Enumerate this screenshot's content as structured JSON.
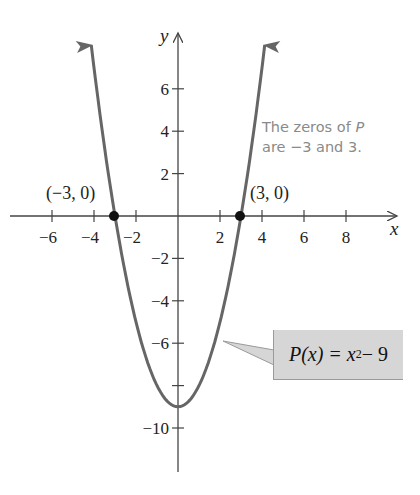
{
  "chart_data": {
    "type": "line",
    "title": "",
    "xlabel": "x",
    "ylabel": "y",
    "function": "P(x) = x^2 - 9",
    "x_ticks": [
      -6,
      -4,
      -2,
      2,
      4,
      6,
      8
    ],
    "y_ticks": [
      6,
      4,
      2,
      -2,
      -4,
      -6,
      -8,
      -10
    ],
    "x_tick_labels": [
      "−6",
      "−4",
      "−2",
      "2",
      "4",
      "6",
      "8"
    ],
    "y_tick_labels": [
      "6",
      "4",
      "2",
      "−2",
      "−4",
      "−6",
      "",
      "−10"
    ],
    "xlim": [
      -8.4,
      10.3
    ],
    "ylim": [
      -12,
      8.6
    ],
    "grid": false,
    "series": [
      {
        "name": "P(x) = x^2 - 9",
        "x": [
          -4.13,
          -4,
          -3.5,
          -3,
          -2.5,
          -2,
          -1.5,
          -1,
          -0.5,
          0,
          0.5,
          1,
          1.5,
          2,
          2.5,
          3,
          3.5,
          4,
          4.13
        ],
        "y": [
          8.06,
          7,
          3.25,
          0,
          -2.75,
          -5,
          -6.75,
          -8,
          -8.75,
          -9,
          -8.75,
          -8,
          -6.75,
          -5,
          -2.75,
          0,
          3.25,
          7,
          8.06
        ]
      }
    ],
    "highlighted_points": [
      {
        "x": -3,
        "y": 0,
        "label": "(−3, 0)"
      },
      {
        "x": 3,
        "y": 0,
        "label": "(3, 0)"
      }
    ],
    "annotations": [
      {
        "text": "The zeros of P are −3 and 3.",
        "color": "#8a8a8a"
      },
      {
        "text": "P(x) = x² − 9",
        "style": "callout box",
        "color": "#d6d6d6"
      }
    ]
  },
  "labels": {
    "x_axis": "x",
    "y_axis": "y",
    "point_left": "(−3, 0)",
    "point_right": "(3, 0)",
    "note_line1_prefix": "The zeros of ",
    "note_line1_var": "P",
    "note_line2": "are −3 and 3.",
    "callout_lhs": "P(x) = x",
    "callout_exp": "2",
    "callout_rhs": " − 9"
  },
  "colors": {
    "curve": "#666666",
    "axis": "#444444",
    "point": "#111111",
    "callout_bg": "#d6d6d6",
    "note_text": "#8a8a8a"
  }
}
